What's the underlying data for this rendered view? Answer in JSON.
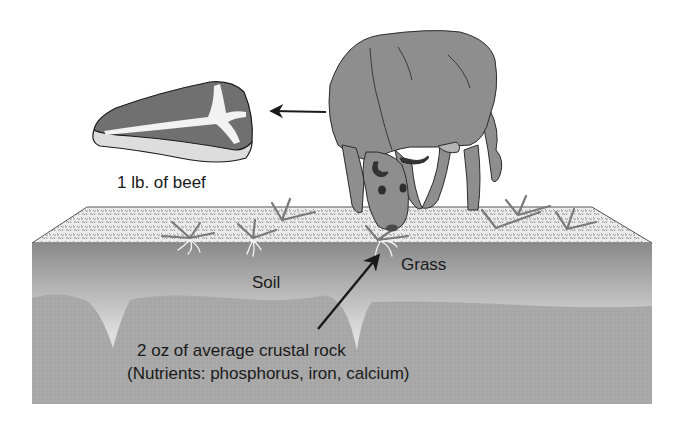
{
  "diagram": {
    "labels": {
      "beef": "1 lb. of beef",
      "soil": "Soil",
      "grass": "Grass",
      "rock_line1": "2 oz of average crustal rock",
      "rock_line2": "(Nutrients: phosphorus, iron, calcium)"
    },
    "elements": [
      "steak",
      "cow",
      "grass",
      "soil-layer",
      "rock-layer",
      "arrow-cow-to-beef",
      "arrow-rock-to-grass"
    ],
    "colors": {
      "background": "#ffffff",
      "surface": "#d9d9d9",
      "soil_top": "#8f8f8f",
      "soil_bottom": "#ececec",
      "rock": "#a9a9a9",
      "cow": "#8c8c8c",
      "meat": "#6e6e6e",
      "fat": "#dcdcdc",
      "outline": "#1a1a1a"
    }
  }
}
